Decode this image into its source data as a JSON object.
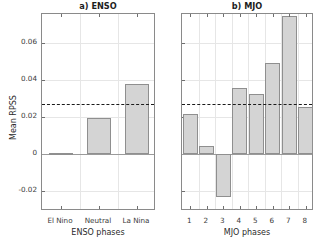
{
  "figure": {
    "ylabel": "Mean RPSS",
    "y_ticks": [
      "0.06",
      "0.04",
      "0.02",
      "0",
      "-0.02"
    ],
    "y_tick_values": [
      0.06,
      0.04,
      0.02,
      0,
      -0.02
    ]
  },
  "chart_data": [
    {
      "type": "bar",
      "title": "a) ENSO",
      "xlabel": "ENSO phases",
      "ylabel": "Mean RPSS",
      "categories": [
        "El Nino",
        "Neutral",
        "La Nina"
      ],
      "values": [
        0.0003,
        0.0195,
        0.0376
      ],
      "ylim": [
        -0.031,
        0.0755
      ],
      "yticks": [
        -0.02,
        0,
        0.02,
        0.04,
        0.06
      ],
      "ytick_labels": [
        "-0.02",
        "0",
        "0.02",
        "0.04",
        "0.06"
      ],
      "grid": true,
      "legend": "none",
      "annotations": [
        {
          "kind": "hline",
          "style": "dashed",
          "value": 0.0269,
          "label": "overall mean RPSS reference"
        },
        {
          "kind": "hline",
          "style": "solid",
          "value": 0,
          "label": "zero line"
        }
      ],
      "bar_color": "#d4d4d4",
      "bar_edge_color": "#8f8f8f"
    },
    {
      "type": "bar",
      "title": "b) MJO",
      "xlabel": "MJO phases",
      "ylabel": "Mean RPSS",
      "categories": [
        "1",
        "2",
        "3",
        "4",
        "5",
        "6",
        "7",
        "8"
      ],
      "values": [
        0.0213,
        0.0039,
        -0.0237,
        0.0356,
        0.032,
        0.0488,
        0.0746,
        0.0254
      ],
      "ylim": [
        -0.031,
        0.0755
      ],
      "yticks": [
        -0.02,
        0,
        0.02,
        0.04,
        0.06
      ],
      "ytick_labels": [
        "-0.02",
        "0",
        "0.02",
        "0.04",
        "0.06"
      ],
      "grid": true,
      "legend": "none",
      "annotations": [
        {
          "kind": "hline",
          "style": "dashed",
          "value": 0.0269,
          "label": "overall mean RPSS reference"
        },
        {
          "kind": "hline",
          "style": "solid",
          "value": 0,
          "label": "zero line"
        }
      ],
      "bar_color": "#d4d4d4",
      "bar_edge_color": "#8f8f8f"
    }
  ]
}
